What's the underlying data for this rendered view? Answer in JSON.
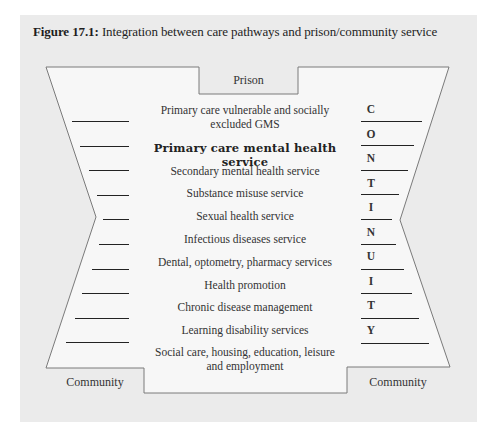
{
  "figure": {
    "label": "Figure 17.1:",
    "title": "Integration between care pathways and prison/community service"
  },
  "diagram": {
    "top_label": "Prison",
    "bottom_left_label": "Community",
    "bottom_right_label": "Community",
    "vertical_word": "CONTINUITY",
    "services": [
      {
        "line1": "Primary care vulnerable and socially",
        "line2": "excluded GMS"
      },
      {
        "line1": "Primary care mental health service",
        "emphasis": true
      },
      {
        "line1": "Secondary mental health service"
      },
      {
        "line1": "Substance misuse service"
      },
      {
        "line1": "Sexual health service"
      },
      {
        "line1": "Infectious diseases service"
      },
      {
        "line1": "Dental, optometry, pharmacy services"
      },
      {
        "line1": "Health promotion"
      },
      {
        "line1": "Chronic disease management"
      },
      {
        "line1": "Learning disability services"
      },
      {
        "line1": "Social care, housing, education, leisure",
        "line2": "and employment"
      }
    ],
    "letters": [
      "C",
      "O",
      "N",
      "T",
      "I",
      "N",
      "U",
      "I",
      "T",
      "Y"
    ],
    "colors": {
      "panel_bg": "#ebebeb",
      "shape_fill": "#f7f7f7",
      "outline": "#7a7a7a",
      "rule": "#222222"
    }
  }
}
